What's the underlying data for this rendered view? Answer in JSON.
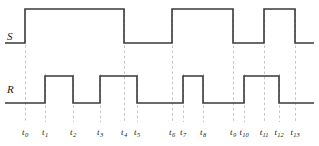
{
  "figure": {
    "kind": "digital-timing-diagram",
    "width": 319,
    "height": 146,
    "background_color": "#ffffff",
    "waveform_color": "#3a3a3a",
    "gridline_color": "#bdbdbd",
    "label_color": "#1a1a1a"
  },
  "signals": [
    {
      "name": "S",
      "label": "S",
      "high_y": 9,
      "low_y": 43,
      "start_level": "low",
      "transitions": [
        {
          "tick": "t0",
          "x": 25,
          "to": "high"
        },
        {
          "tick": "t4",
          "x": 124,
          "to": "low"
        },
        {
          "tick": "t6",
          "x": 172,
          "to": "high"
        },
        {
          "tick": "t9",
          "x": 233,
          "to": "low"
        },
        {
          "tick": "t11",
          "x": 264,
          "to": "high"
        },
        {
          "tick": "t13",
          "x": 295,
          "to": "low"
        }
      ],
      "end_x": 314
    },
    {
      "name": "R",
      "label": "R",
      "high_y": 76,
      "low_y": 103,
      "start_level": "low",
      "transitions": [
        {
          "tick": "t1",
          "x": 45,
          "to": "high"
        },
        {
          "tick": "t2",
          "x": 73,
          "to": "low"
        },
        {
          "tick": "t3",
          "x": 100,
          "to": "high"
        },
        {
          "tick": "t5",
          "x": 137,
          "to": "low"
        },
        {
          "tick": "t7",
          "x": 183,
          "to": "high"
        },
        {
          "tick": "t8",
          "x": 203,
          "to": "low"
        },
        {
          "tick": "t10",
          "x": 244,
          "to": "high"
        },
        {
          "tick": "t12",
          "x": 279,
          "to": "low"
        }
      ],
      "end_x": 314
    }
  ],
  "signal_labels": [
    {
      "id": "S",
      "text": "S",
      "x": 7,
      "y": 31
    },
    {
      "id": "R",
      "text": "R",
      "x": 7,
      "y": 84
    }
  ],
  "time_axis": {
    "label_y": 128,
    "gridline_top": 9,
    "gridline_bottom": 122,
    "ticks": [
      {
        "id": "t0",
        "base": "t",
        "sub": "0",
        "x": 25,
        "gridline_top": 40,
        "gridline_bottom": 122
      },
      {
        "id": "t1",
        "base": "t",
        "sub": "1",
        "x": 45,
        "gridline_top": 74,
        "gridline_bottom": 122
      },
      {
        "id": "t2",
        "base": "t",
        "sub": "2",
        "x": 73,
        "gridline_top": 74,
        "gridline_bottom": 122
      },
      {
        "id": "t3",
        "base": "t",
        "sub": "3",
        "x": 100,
        "gridline_top": 74,
        "gridline_bottom": 122
      },
      {
        "id": "t4",
        "base": "t",
        "sub": "4",
        "x": 124,
        "gridline_top": 9,
        "gridline_bottom": 122
      },
      {
        "id": "t5",
        "base": "t",
        "sub": "5",
        "x": 137,
        "gridline_top": 74,
        "gridline_bottom": 122
      },
      {
        "id": "t6",
        "base": "t",
        "sub": "6",
        "x": 172,
        "gridline_top": 9,
        "gridline_bottom": 122
      },
      {
        "id": "t7",
        "base": "t",
        "sub": "7",
        "x": 183,
        "gridline_top": 74,
        "gridline_bottom": 122
      },
      {
        "id": "t8",
        "base": "t",
        "sub": "8",
        "x": 203,
        "gridline_top": 74,
        "gridline_bottom": 122
      },
      {
        "id": "t9",
        "base": "t",
        "sub": "9",
        "x": 233,
        "gridline_top": 9,
        "gridline_bottom": 122
      },
      {
        "id": "t10",
        "base": "t",
        "sub": "10",
        "x": 244,
        "gridline_top": 74,
        "gridline_bottom": 122
      },
      {
        "id": "t11",
        "base": "t",
        "sub": "11",
        "x": 264,
        "gridline_top": 9,
        "gridline_bottom": 122
      },
      {
        "id": "t12",
        "base": "t",
        "sub": "12",
        "x": 279,
        "gridline_top": 74,
        "gridline_bottom": 122
      },
      {
        "id": "t13",
        "base": "t",
        "sub": "13",
        "x": 295,
        "gridline_top": 9,
        "gridline_bottom": 122
      }
    ]
  },
  "chart_data": {
    "type": "line",
    "title": "",
    "xlabel": "",
    "ylabel": "",
    "x": [
      "t0",
      "t1",
      "t2",
      "t3",
      "t4",
      "t5",
      "t6",
      "t7",
      "t8",
      "t9",
      "t10",
      "t11",
      "t12",
      "t13"
    ],
    "series": [
      {
        "name": "S",
        "values": [
          1,
          1,
          1,
          1,
          0,
          0,
          1,
          1,
          1,
          0,
          0,
          1,
          1,
          0
        ]
      },
      {
        "name": "R",
        "values": [
          0,
          1,
          0,
          1,
          1,
          0,
          0,
          1,
          0,
          0,
          1,
          1,
          0,
          0
        ]
      }
    ],
    "legend_position": "left-axis-labels",
    "grid": true,
    "ylim": [
      0,
      1
    ]
  }
}
